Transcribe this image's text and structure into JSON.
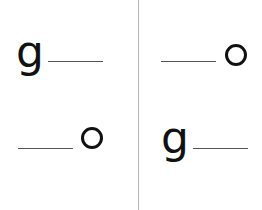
{
  "worksheet": {
    "cells": [
      {
        "position": "top-left",
        "letter": "g",
        "blank_side": "right"
      },
      {
        "position": "top-right",
        "letter": "o",
        "blank_side": "left"
      },
      {
        "position": "bottom-left",
        "letter": "o",
        "blank_side": "left"
      },
      {
        "position": "bottom-right",
        "letter": "g",
        "blank_side": "right"
      }
    ],
    "colors": {
      "text": "#111111",
      "line": "#555555",
      "divider": "#b8b8b8"
    }
  }
}
